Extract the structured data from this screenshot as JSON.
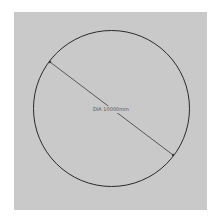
{
  "canvas": {
    "background": "#c9c9c9",
    "page_background": "#ffffff"
  },
  "circle": {
    "cx": 111.5,
    "cy": 108.5,
    "r": 78,
    "stroke": "#2a2a2a",
    "stroke_width": 1
  },
  "dimension": {
    "type": "diameter",
    "label": "DIA 10000mm",
    "line": {
      "x1": 50,
      "y1": 62,
      "x2": 173,
      "y2": 155,
      "stroke": "#3a3a3a"
    },
    "label_position": {
      "x": 111,
      "y": 111
    }
  }
}
